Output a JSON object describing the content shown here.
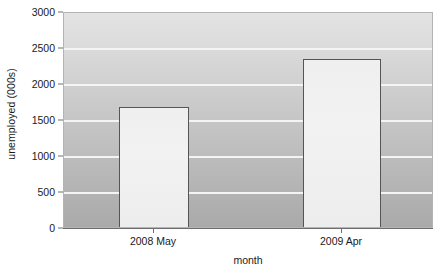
{
  "chart_data": {
    "type": "bar",
    "title": "",
    "subtitle": "",
    "xlabel": "month",
    "ylabel": "unemployed (000s)",
    "categories": [
      "2008 May",
      "2009 Apr"
    ],
    "values": [
      1670,
      2340
    ],
    "series": [
      {
        "name": "unemployed",
        "values": [
          1670,
          2340
        ]
      }
    ],
    "ylim": [
      0,
      3000
    ],
    "y_ticks": [
      0,
      500,
      1000,
      1500,
      2000,
      2500,
      3000
    ],
    "y_tick_labels": [
      "0",
      "500",
      "1000",
      "1500",
      "2000",
      "2500",
      "3000"
    ],
    "grid": true,
    "grid_axis": "y",
    "legend": false,
    "legend_position": "none",
    "annotations": [],
    "colors": {
      "bar_fill": "#f0f0f0",
      "bar_edge": "#555555",
      "plot_background_top": "#e3e3e3",
      "plot_background_bottom": "#aaaaaa",
      "gridline": "#f4f4f4",
      "axis_line": "#6e6e6e",
      "text": "#1a1a1a"
    }
  }
}
